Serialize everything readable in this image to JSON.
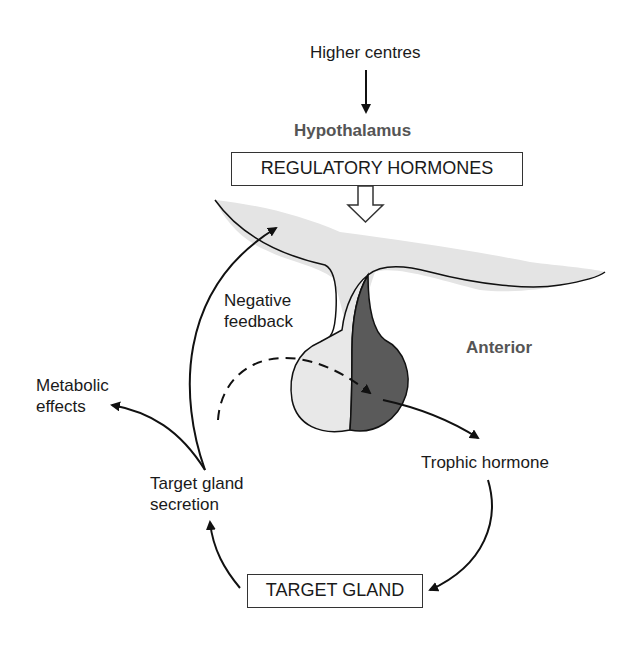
{
  "labels": {
    "higher_centres": "Higher centres",
    "hypothalamus": "Hypothalamus",
    "regulatory_hormones": "REGULATORY HORMONES",
    "negative_feedback_line1": "Negative",
    "negative_feedback_line2": "feedback",
    "anterior": "Anterior",
    "metabolic_effects_line1": "Metabolic",
    "metabolic_effects_line2": "effects",
    "trophic_hormone": "Trophic hormone",
    "target_gland_secretion_line1": "Target gland",
    "target_gland_secretion_line2": "secretion",
    "target_gland": "TARGET GLAND"
  },
  "colors": {
    "hypothalamus_fill": "#e4e4e4",
    "posterior_fill": "#e8e8e8",
    "anterior_fill": "#5a5a5a",
    "stroke": "#111111"
  }
}
